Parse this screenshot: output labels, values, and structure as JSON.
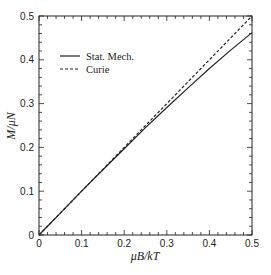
{
  "chart_data": {
    "type": "line",
    "title": "",
    "xlabel": "μB/kT",
    "ylabel": "M/μN",
    "xlim": [
      0,
      0.5
    ],
    "ylim": [
      0,
      0.5
    ],
    "xticks": [
      0,
      0.1,
      0.2,
      0.3,
      0.4,
      0.5
    ],
    "xtick_labels": [
      "0",
      "0.1",
      "0.2",
      "0.3",
      "0.4",
      "0.5"
    ],
    "yticks": [
      0,
      0.1,
      0.2,
      0.3,
      0.4,
      0.5
    ],
    "ytick_labels": [
      "0",
      "0.1",
      "0.2",
      "0.3",
      "0.4",
      "0.5"
    ],
    "minor_tick_step": 0.02,
    "grid": false,
    "legend_position": "upper left",
    "series": [
      {
        "name": "Stat. Mech.",
        "style": "solid",
        "x": [
          0,
          0.05,
          0.1,
          0.15,
          0.2,
          0.25,
          0.3,
          0.35,
          0.4,
          0.45,
          0.5
        ],
        "values": [
          0,
          0.05,
          0.1,
          0.149,
          0.197,
          0.245,
          0.291,
          0.336,
          0.38,
          0.422,
          0.462
        ]
      },
      {
        "name": "Curie",
        "style": "dashed",
        "x": [
          0,
          0.05,
          0.1,
          0.15,
          0.2,
          0.25,
          0.3,
          0.35,
          0.4,
          0.45,
          0.5
        ],
        "values": [
          0,
          0.05,
          0.1,
          0.15,
          0.2,
          0.25,
          0.3,
          0.35,
          0.4,
          0.45,
          0.5
        ]
      }
    ]
  }
}
